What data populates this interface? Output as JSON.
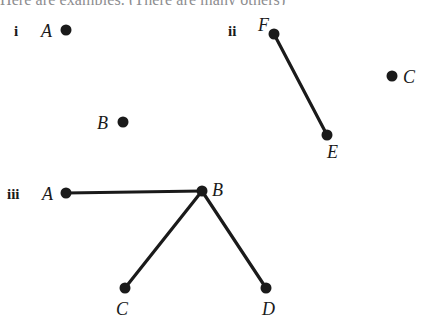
{
  "figure": {
    "width": 427,
    "height": 336,
    "background_color": "#ffffff",
    "ink_color": "#1a1a1a",
    "clipped_caption_color": "#8d8d8f",
    "clipped_caption_text": "Here are examples. (There are many others)",
    "vertex_dot_radius": 5.5,
    "edge_stroke_width": 3.2
  },
  "groups": [
    {
      "numeral": "i",
      "numeral_pos": {
        "x": 14,
        "y": 24
      },
      "vertices": [
        {
          "id": "A",
          "label": "A",
          "x": 66,
          "y": 30,
          "label_x": 41,
          "label_y": 22,
          "label_side": "left"
        },
        {
          "id": "B",
          "label": "B",
          "x": 123,
          "y": 122,
          "label_x": 97,
          "label_y": 114,
          "label_side": "left"
        }
      ],
      "edges": []
    },
    {
      "numeral": "ii",
      "numeral_pos": {
        "x": 228,
        "y": 24
      },
      "vertices": [
        {
          "id": "F",
          "label": "F",
          "x": 274,
          "y": 34,
          "label_x": 258,
          "label_y": 16,
          "label_side": "above-left"
        },
        {
          "id": "E",
          "label": "E",
          "x": 327,
          "y": 135,
          "label_x": 327,
          "label_y": 143,
          "label_side": "below"
        },
        {
          "id": "C",
          "label": "C",
          "x": 392,
          "y": 76,
          "label_x": 403,
          "label_y": 68,
          "label_side": "right"
        }
      ],
      "edges": [
        {
          "from": "F",
          "to": "E"
        }
      ]
    },
    {
      "numeral": "iii",
      "numeral_pos": {
        "x": 7,
        "y": 187
      },
      "vertices": [
        {
          "id": "A",
          "label": "A",
          "x": 66,
          "y": 193,
          "label_x": 42,
          "label_y": 185,
          "label_side": "left"
        },
        {
          "id": "B",
          "label": "B",
          "x": 202,
          "y": 191,
          "label_x": 212,
          "label_y": 181,
          "label_side": "right"
        },
        {
          "id": "C",
          "label": "C",
          "x": 125,
          "y": 288,
          "label_x": 116,
          "label_y": 300,
          "label_side": "below"
        },
        {
          "id": "D",
          "label": "D",
          "x": 266,
          "y": 288,
          "label_x": 262,
          "label_y": 300,
          "label_side": "below"
        }
      ],
      "edges": [
        {
          "from": "A",
          "to": "B"
        },
        {
          "from": "B",
          "to": "C"
        },
        {
          "from": "B",
          "to": "D"
        }
      ]
    }
  ]
}
